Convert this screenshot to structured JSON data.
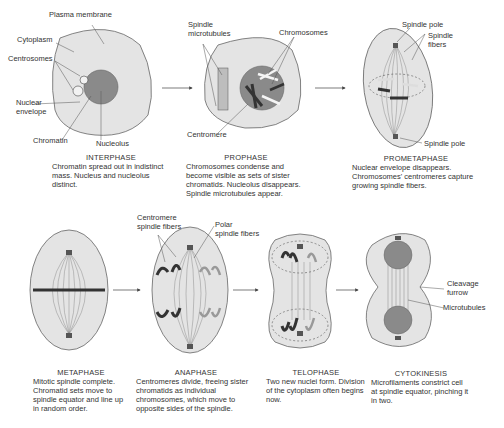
{
  "colors": {
    "cell_fill": "#e4e4e4",
    "nucleus_fill": "#8a8a8a",
    "outline": "#555555",
    "chromosome_dark": "#333333"
  },
  "stages": [
    {
      "name": "INTERPHASE",
      "description": "Chromatin spread out in indistinct mass. Nucleus and nucleolus distinct.",
      "labels": [
        "Plasma membrane",
        "Cytoplasm",
        "Centrosomes",
        "Nuclear",
        "envelope",
        "Chromatin",
        "Nucleolus"
      ]
    },
    {
      "name": "PROPHASE",
      "description": "Chromosomes condense and become visible as sets of sister chromatids. Nucleolus disappears. Spindle microtubules appear.",
      "labels": [
        "Spindle",
        "microtubules",
        "Chromosomes",
        "Centromere"
      ]
    },
    {
      "name": "PROMETAPHASE",
      "description": "Nuclear envelope disappears. Chromosomes' centromeres capture growing spindle fibers.",
      "labels": [
        "Spindle pole",
        "Spindle",
        "fibers",
        "Spindle pole"
      ]
    },
    {
      "name": "METAPHASE",
      "description": "Mitotic spindle complete. Chromatid sets move to spindle equator and line up in random order.",
      "labels": []
    },
    {
      "name": "ANAPHASE",
      "description": "Centromeres divide, freeing sister chromatids as individual chromosomes, which move to opposite sides of the spindle.",
      "labels": [
        "Centromere",
        "spindle fibers",
        "Polar",
        "spindle fibers"
      ]
    },
    {
      "name": "TELOPHASE",
      "description": "Two new nuclei form. Division of the cytoplasm often begins now.",
      "labels": []
    },
    {
      "name": "CYTOKINESIS",
      "description": "Microfilaments constrict cell at spindle equator, pinching it in two.",
      "labels": [
        "Cleavage",
        "furrow",
        "Microtubules"
      ]
    }
  ]
}
